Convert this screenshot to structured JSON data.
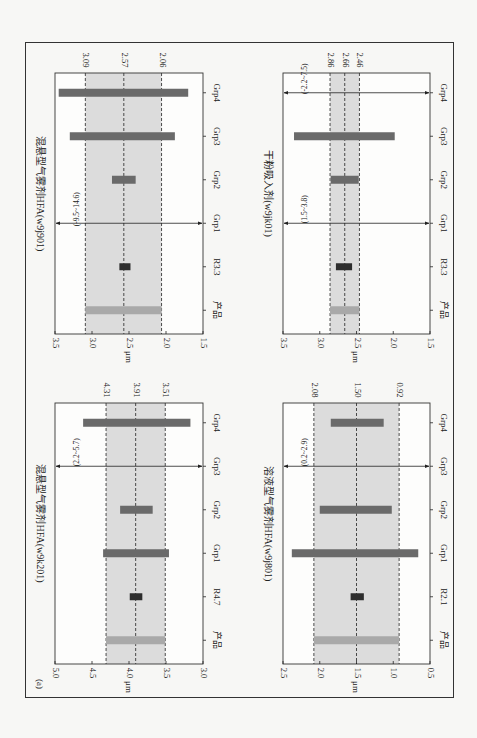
{
  "figure": {
    "label": "(a)",
    "rotation": "90deg clockwise (page rotated)",
    "unit_label": "μm"
  },
  "chart_data": [
    {
      "type": "bar",
      "subtype": "floating-range",
      "id": "top-left",
      "title": "混悬型气雾剂HFA(w9j901)",
      "ylabel": "μm",
      "xlabel": "",
      "ylim": [
        1.5,
        3.5
      ],
      "yticks": [
        "1.5",
        "2.0",
        "2.5",
        "3.0",
        "3.5"
      ],
      "categories": [
        "产品",
        "R3.3",
        "Grp1",
        "Grp2",
        "Grp3",
        "Grp4"
      ],
      "reference_lines": [
        {
          "label": "3.09",
          "value": 3.09
        },
        {
          "label": "2.57",
          "value": 2.57
        },
        {
          "label": "2.06",
          "value": 2.06
        }
      ],
      "shaded_band": [
        2.06,
        3.09
      ],
      "ranges": [
        {
          "category": "产品",
          "low": 2.06,
          "high": 3.09,
          "color": "#a9a9a9"
        },
        {
          "category": "R3.3",
          "low": 2.48,
          "high": 2.63,
          "color": "#2e2e2e"
        },
        {
          "category": "Grp1",
          "low": -9.5,
          "high": 14.6,
          "offscale": true,
          "annotation": "(-9.5~14.6)"
        },
        {
          "category": "Grp2",
          "low": 2.41,
          "high": 2.73,
          "color": "#6a6a6a"
        },
        {
          "category": "Grp3",
          "low": 1.88,
          "high": 3.3,
          "color": "#6a6a6a"
        },
        {
          "category": "Grp4",
          "low": 1.7,
          "high": 3.45,
          "color": "#6a6a6a"
        }
      ]
    },
    {
      "type": "bar",
      "subtype": "floating-range",
      "id": "top-right",
      "title": "干粉吸入剂(w9jk01)",
      "ylabel": "μm",
      "xlabel": "",
      "ylim": [
        1.5,
        3.5
      ],
      "yticks": [
        "1.5",
        "2.0",
        "2.5",
        "3.0",
        "3.5"
      ],
      "categories": [
        "产品",
        "R3.3",
        "Grp1",
        "Grp2",
        "Grp3",
        "Grp4"
      ],
      "reference_lines": [
        {
          "label": "2.86",
          "value": 2.86
        },
        {
          "label": "2.66",
          "value": 2.66
        },
        {
          "label": "2.46",
          "value": 2.46
        }
      ],
      "shaded_band": [
        2.46,
        2.86
      ],
      "ranges": [
        {
          "category": "产品",
          "low": 2.46,
          "high": 2.86,
          "color": "#a9a9a9"
        },
        {
          "category": "R3.3",
          "low": 2.56,
          "high": 2.78,
          "color": "#2e2e2e"
        },
        {
          "category": "Grp1",
          "low": 1.5,
          "high": 3.8,
          "offscale": true,
          "annotation": "(1.5~3.8)"
        },
        {
          "category": "Grp2",
          "low": 2.47,
          "high": 2.85,
          "color": "#6a6a6a"
        },
        {
          "category": "Grp3",
          "low": 1.98,
          "high": 3.35,
          "color": "#6a6a6a"
        },
        {
          "category": "Grp4",
          "low": -2.2,
          "high": 7.5,
          "offscale": true,
          "annotation": "(-2.2~7.5)"
        }
      ]
    },
    {
      "type": "bar",
      "subtype": "floating-range",
      "id": "bottom-left",
      "title": "混悬型气雾剂HFA(w9k201)",
      "ylabel": "μm",
      "xlabel": "",
      "ylim": [
        3.0,
        5.0
      ],
      "yticks": [
        "3.0",
        "3.5",
        "4.0",
        "4.5",
        "5.0"
      ],
      "categories": [
        "产品",
        "R4.7",
        "Grp1",
        "Grp2",
        "Grp3",
        "Grp4"
      ],
      "reference_lines": [
        {
          "label": "4.31",
          "value": 4.31
        },
        {
          "label": "3.91",
          "value": 3.91
        },
        {
          "label": "3.51",
          "value": 3.51
        }
      ],
      "shaded_band": [
        3.51,
        4.31
      ],
      "ranges": [
        {
          "category": "产品",
          "low": 3.51,
          "high": 4.31,
          "color": "#a9a9a9"
        },
        {
          "category": "R4.7",
          "low": 3.82,
          "high": 3.99,
          "color": "#2e2e2e"
        },
        {
          "category": "Grp1",
          "low": 3.46,
          "high": 4.35,
          "color": "#6a6a6a"
        },
        {
          "category": "Grp2",
          "low": 3.68,
          "high": 4.12,
          "color": "#6a6a6a"
        },
        {
          "category": "Grp3",
          "low": 2.2,
          "high": 5.7,
          "offscale": true,
          "annotation": "(2.2~5.7)"
        },
        {
          "category": "Grp4",
          "low": 3.17,
          "high": 4.62,
          "color": "#6a6a6a"
        }
      ]
    },
    {
      "type": "bar",
      "subtype": "floating-range",
      "id": "bottom-right",
      "title": "溶液型气雾剂HFA(w9j801)",
      "ylabel": "μm",
      "xlabel": "",
      "ylim": [
        0.5,
        2.5
      ],
      "yticks": [
        "0.5",
        "1.0",
        "1.5",
        "2.0",
        "2.5"
      ],
      "categories": [
        "产品",
        "R2.1",
        "Grp1",
        "Grp2",
        "Grp3",
        "Grp4"
      ],
      "reference_lines": [
        {
          "label": "2.08",
          "value": 2.08
        },
        {
          "label": "1.50",
          "value": 1.5
        },
        {
          "label": "0.92",
          "value": 0.92
        }
      ],
      "shaded_band": [
        0.92,
        2.08
      ],
      "ranges": [
        {
          "category": "产品",
          "low": 0.92,
          "high": 2.08,
          "color": "#a9a9a9"
        },
        {
          "category": "R2.1",
          "low": 1.4,
          "high": 1.58,
          "color": "#2e2e2e"
        },
        {
          "category": "Grp1",
          "low": 0.66,
          "high": 2.38,
          "color": "#6a6a6a"
        },
        {
          "category": "Grp2",
          "low": 1.02,
          "high": 2.0,
          "color": "#6a6a6a"
        },
        {
          "category": "Grp3",
          "low": 0.2,
          "high": 2.9,
          "offscale": true,
          "annotation": "(0.2~2.9)"
        },
        {
          "category": "Grp4",
          "low": 1.13,
          "high": 1.85,
          "color": "#6a6a6a"
        }
      ]
    }
  ],
  "colors": {
    "page_bg": "#f7f7f5",
    "band": "#dcdcdc",
    "frame": "#333333",
    "product_bar": "#a9a9a9",
    "reference_bar": "#2e2e2e",
    "group_bar": "#6a6a6a"
  }
}
